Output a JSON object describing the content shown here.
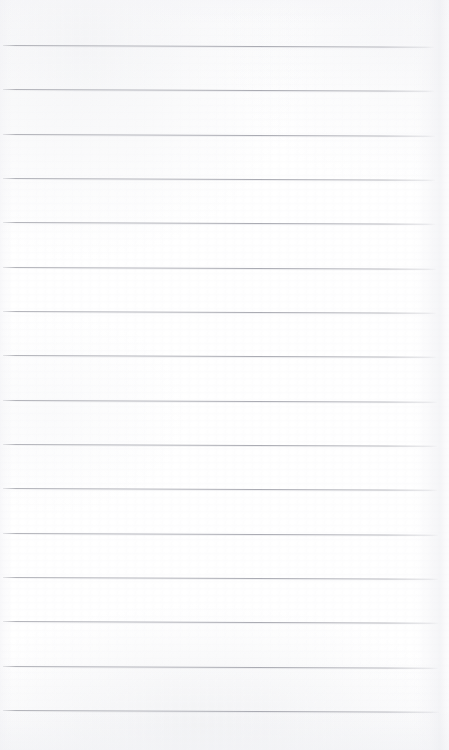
{
  "document": {
    "kind": "scanned-blank-ruled-notebook-page",
    "title": "Blank Ruled Notebook Page",
    "page_width": 449,
    "page_height": 750,
    "paper_color": "#ffffff",
    "paper_tint": "#fcfcfd",
    "has_visible_text": false,
    "has_handwriting": false,
    "has_margin_rule": false,
    "has_holes": false,
    "text_content": ""
  },
  "ruling": {
    "line_color": "#b0b1b8",
    "line_thickness_px": 1,
    "line_count": 16,
    "line_spacing_px": 44.3,
    "first_line_y": 45,
    "last_line_y": 710,
    "line_start_x": 3,
    "line_end_x": 437,
    "tilt_degrees": 0.22,
    "lines": [
      {
        "index": 1,
        "y": 45,
        "x_start": 3,
        "x_end": 434
      },
      {
        "index": 2,
        "y": 89,
        "x_start": 3,
        "x_end": 434
      },
      {
        "index": 3,
        "y": 134,
        "x_start": 3,
        "x_end": 435
      },
      {
        "index": 4,
        "y": 178,
        "x_start": 3,
        "x_end": 435
      },
      {
        "index": 5,
        "y": 222,
        "x_start": 3,
        "x_end": 435
      },
      {
        "index": 6,
        "y": 267,
        "x_start": 3,
        "x_end": 436
      },
      {
        "index": 7,
        "y": 311,
        "x_start": 3,
        "x_end": 436
      },
      {
        "index": 8,
        "y": 355,
        "x_start": 3,
        "x_end": 436
      },
      {
        "index": 9,
        "y": 400,
        "x_start": 3,
        "x_end": 437
      },
      {
        "index": 10,
        "y": 444,
        "x_start": 3,
        "x_end": 437
      },
      {
        "index": 11,
        "y": 488,
        "x_start": 3,
        "x_end": 437
      },
      {
        "index": 12,
        "y": 533,
        "x_start": 3,
        "x_end": 438
      },
      {
        "index": 13,
        "y": 577,
        "x_start": 3,
        "x_end": 438
      },
      {
        "index": 14,
        "y": 621,
        "x_start": 3,
        "x_end": 438
      },
      {
        "index": 15,
        "y": 666,
        "x_start": 3,
        "x_end": 438
      },
      {
        "index": 16,
        "y": 710,
        "x_start": 3,
        "x_end": 439
      }
    ]
  },
  "shading": {
    "right_edge_shadow": true,
    "left_edge_shadow": true,
    "top_edge_shadow": true,
    "bottom_edge_shadow": true,
    "shadow_color": "#ecedf1"
  },
  "writing_areas": {
    "count": 17,
    "labels": [
      "",
      "",
      "",
      "",
      "",
      "",
      "",
      "",
      "",
      "",
      "",
      "",
      "",
      "",
      "",
      "",
      ""
    ]
  }
}
